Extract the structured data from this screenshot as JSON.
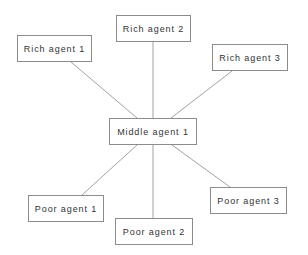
{
  "diagram": {
    "type": "star-network",
    "center": {
      "id": "middle1",
      "label": "Middle agent 1",
      "x": 109,
      "y": 118,
      "w": 88,
      "h": 27
    },
    "nodes": [
      {
        "id": "rich1",
        "label": "Rich agent 1",
        "x": 17,
        "y": 35,
        "w": 75,
        "h": 27
      },
      {
        "id": "rich2",
        "label": "Rich agent 2",
        "x": 116,
        "y": 15,
        "w": 75,
        "h": 27
      },
      {
        "id": "rich3",
        "label": "Rich agent 3",
        "x": 212,
        "y": 44,
        "w": 76,
        "h": 27
      },
      {
        "id": "poor1",
        "label": "Poor agent 1",
        "x": 28,
        "y": 195,
        "w": 76,
        "h": 27
      },
      {
        "id": "poor2",
        "label": "Poor agent 2",
        "x": 115,
        "y": 218,
        "w": 78,
        "h": 27
      },
      {
        "id": "poor3",
        "label": "Poor agent 3",
        "x": 210,
        "y": 187,
        "w": 77,
        "h": 27
      }
    ],
    "edges": [
      {
        "from": "middle1",
        "to": "rich1",
        "x1": 137,
        "y1": 118,
        "x2": 71,
        "y2": 62
      },
      {
        "from": "middle1",
        "to": "rich2",
        "x1": 153,
        "y1": 118,
        "x2": 153,
        "y2": 42
      },
      {
        "from": "middle1",
        "to": "rich3",
        "x1": 171,
        "y1": 118,
        "x2": 232,
        "y2": 71
      },
      {
        "from": "middle1",
        "to": "poor1",
        "x1": 137,
        "y1": 145,
        "x2": 82,
        "y2": 195
      },
      {
        "from": "middle1",
        "to": "poor2",
        "x1": 153,
        "y1": 145,
        "x2": 153,
        "y2": 218
      },
      {
        "from": "middle1",
        "to": "poor3",
        "x1": 172,
        "y1": 145,
        "x2": 230,
        "y2": 187
      }
    ]
  },
  "labels": {
    "middle1": "Middle agent 1",
    "rich1": "Rich agent 1",
    "rich2": "Rich agent 2",
    "rich3": "Rich agent 3",
    "poor1": "Poor agent 1",
    "poor2": "Poor agent 2",
    "poor3": "Poor agent 3"
  },
  "colors": {
    "background": "#ffffff",
    "box_border": "#8c8c8c",
    "edge": "#8a8a8a",
    "text": "#333333"
  }
}
